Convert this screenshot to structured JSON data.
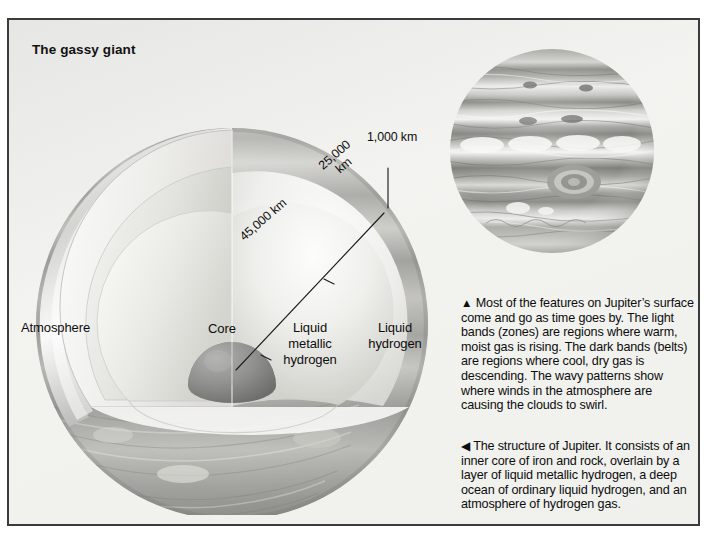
{
  "figure": {
    "title": "The gassy giant",
    "border_color": "#3b3b3b",
    "background_color": "#f2f2ef",
    "text_color": "#0d0d0d"
  },
  "diagram": {
    "name": "jupiter-cutaway-cross-section",
    "layer_labels": {
      "atmosphere": "Atmosphere",
      "core": "Core",
      "liquid_metallic_hydrogen": "Liquid\nmetallic\nhydrogen",
      "liquid_hydrogen": "Liquid\nhydrogen"
    },
    "dimensions": [
      {
        "name": "atmosphere-depth",
        "label": "1,000 km",
        "value": 1000,
        "unit": "km"
      },
      {
        "name": "liquid-hydrogen-depth",
        "label": "25,000\nkm",
        "value": 25000,
        "unit": "km"
      },
      {
        "name": "liquid-metallic-hydrogen-depth",
        "label": "45,000 km",
        "value": 45000,
        "unit": "km"
      }
    ]
  },
  "photo": {
    "name": "jupiter-surface-photograph",
    "description": "Grayscale photograph of Jupiter showing banded cloud belts and zones with the Great Red Spot"
  },
  "captions": {
    "top": {
      "arrow": "▲",
      "text": "Most of the features on Jupiter’s surface come and go as time goes by. The light bands (zones) are regions where warm, moist gas is rising. The dark bands (belts) are regions where cool, dry gas is descending. The wavy patterns show where winds in the atmosphere are causing the clouds to swirl."
    },
    "bottom": {
      "arrow": "◀",
      "text": "The structure of Jupiter. It consists of an inner core of iron and rock, overlain by a layer of liquid metallic hydrogen, a deep ocean of ordinary liquid hydrogen, and an atmosphere of hydrogen gas."
    }
  }
}
